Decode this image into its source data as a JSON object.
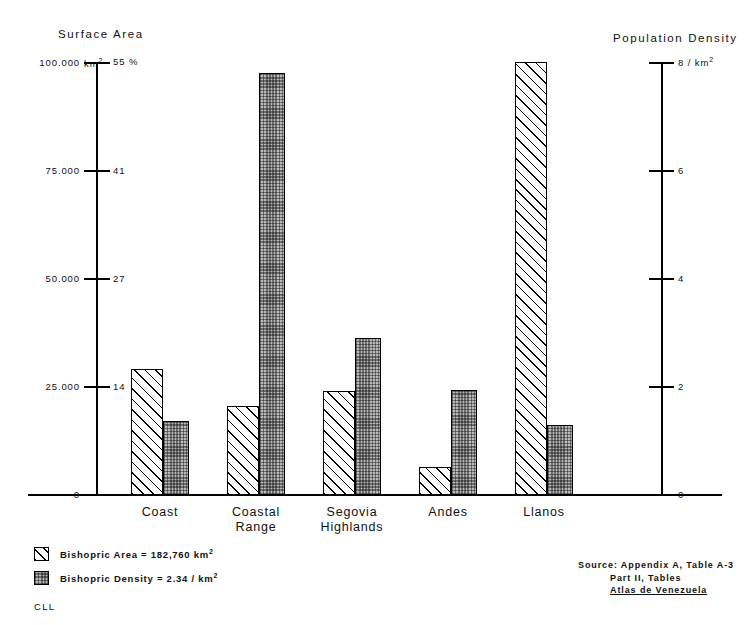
{
  "chart_data": {
    "type": "bar",
    "title": "",
    "categories": [
      "Coast",
      "Coastal Range",
      "Segovia Highlands",
      "Andes",
      "Llanos"
    ],
    "category_lines": [
      [
        "Coast"
      ],
      [
        "Coastal",
        "Range"
      ],
      [
        "Segovia",
        "Highlands"
      ],
      [
        "Andes"
      ],
      [
        "Llanos"
      ]
    ],
    "series": [
      {
        "name": "Bishopric Area",
        "unit": "km2",
        "axis": "left",
        "pattern": "diagonal-hatch",
        "values": [
          29000,
          20500,
          24000,
          6500,
          100000
        ]
      },
      {
        "name": "Bishopric Density",
        "unit": "per km2",
        "axis": "right",
        "pattern": "stipple-gray",
        "values": [
          1.37,
          7.8,
          2.9,
          1.94,
          1.3
        ]
      }
    ],
    "left_axis": {
      "title": "Surface  Area",
      "unit": "km2",
      "range": [
        0,
        100000
      ],
      "ticks": [
        "0",
        "25.000",
        "50.000",
        "75.000",
        "100.000"
      ],
      "tick_values": [
        0,
        25000,
        50000,
        75000,
        100000
      ],
      "secondary_ticks": [
        "0",
        "14",
        "27",
        "41",
        "55 %"
      ],
      "secondary_tick_values": [
        0,
        14,
        27,
        41,
        55
      ],
      "secondary_unit": "%"
    },
    "right_axis": {
      "title": "Population  Density",
      "unit": "/ km2",
      "range": [
        0,
        8
      ],
      "ticks": [
        "0",
        "2",
        "4",
        "6",
        "8 / km2"
      ],
      "tick_values": [
        0,
        2,
        4,
        6,
        8
      ]
    },
    "grid": false,
    "legend_position": "bottom-left"
  },
  "titles": {
    "left": "Surface  Area",
    "right": "Population  Density"
  },
  "left_axis_labels": {
    "area": [
      "0",
      "25.000",
      "50.000",
      "75.000",
      "100.000"
    ],
    "top_unit": "km",
    "top_unit_sup": "2",
    "percent": [
      "0",
      "14",
      "27",
      "41",
      "55 %"
    ]
  },
  "right_axis_labels": {
    "density": [
      "0",
      "2",
      "4",
      "6",
      "8 / km"
    ],
    "top_unit_sup": "2"
  },
  "legend": {
    "area": {
      "label": "Bishopric   Area = 182,760  km",
      "sup": "2",
      "swatch": "diagonal-hatch-swatch"
    },
    "density": {
      "label": "Bishopric   Density = 2.34 / km",
      "sup": "2",
      "swatch": "stipple-gray-swatch"
    }
  },
  "credit": "CLL",
  "source": {
    "line1": "Source:  Appendix  A,  Table  A-3",
    "line2": "Part II,  Tables",
    "line3": "Atlas  de  Venezuela"
  }
}
